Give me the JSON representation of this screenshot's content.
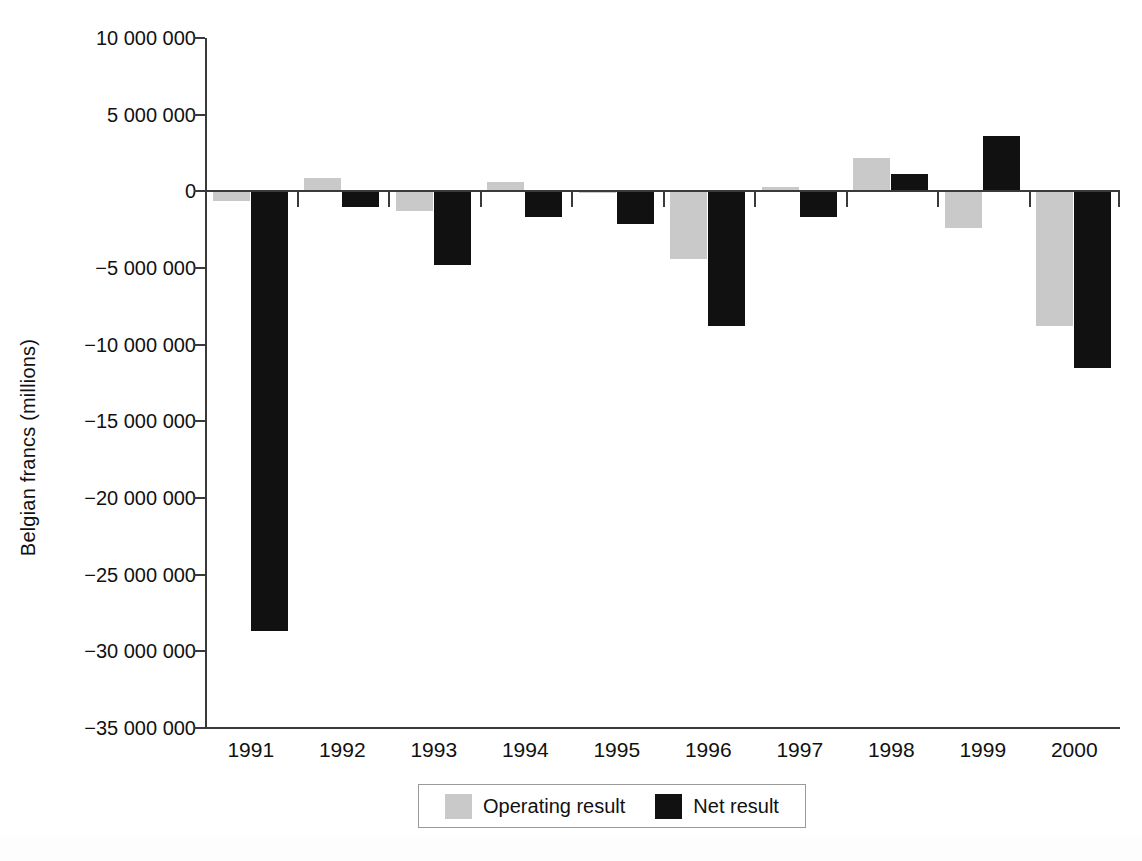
{
  "chart_data": {
    "type": "bar",
    "title": "",
    "xlabel": "",
    "ylabel": "Belgian francs (millions)",
    "categories": [
      "1991",
      "1992",
      "1993",
      "1994",
      "1995",
      "1996",
      "1997",
      "1998",
      "1999",
      "2000"
    ],
    "series": [
      {
        "name": "Operating result",
        "color": "#c9c9c9",
        "values": [
          -600000,
          900000,
          -1300000,
          600000,
          -100000,
          -4400000,
          300000,
          2200000,
          -2400000,
          -8800000
        ]
      },
      {
        "name": "Net result",
        "color": "#111111",
        "values": [
          -28700000,
          -1000000,
          -4800000,
          -1700000,
          -2100000,
          -8800000,
          -1700000,
          1100000,
          3600000,
          -11500000
        ]
      }
    ],
    "ylim": [
      -35000000,
      10000000
    ],
    "yticks": [
      10000000,
      5000000,
      0,
      -5000000,
      -10000000,
      -15000000,
      -20000000,
      -25000000,
      -30000000,
      -35000000
    ],
    "ytick_labels": [
      "10 000 000",
      "5 000 000",
      "0",
      "−5 000 000",
      "−10 000 000",
      "−15 000 000",
      "−20 000 000",
      "−25 000 000",
      "−30 000 000",
      "−35 000 000"
    ],
    "grid": false,
    "legend_position": "bottom"
  },
  "legend": {
    "items": [
      {
        "label": "Operating result",
        "swatch": "gray"
      },
      {
        "label": "Net result",
        "swatch": "black"
      }
    ]
  }
}
